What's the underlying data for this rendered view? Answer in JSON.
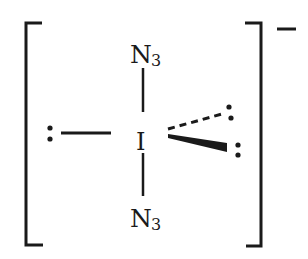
{
  "diagram": {
    "type": "lewis-structure",
    "charge": "−",
    "central_atom": "I",
    "top_group": {
      "element": "N",
      "subscript": "3"
    },
    "bottom_group": {
      "element": "N",
      "subscript": "3"
    },
    "ligands": [
      {
        "position": "axial-top",
        "label": "N3",
        "bond": "single"
      },
      {
        "position": "axial-bottom",
        "label": "N3",
        "bond": "single"
      },
      {
        "position": "equatorial-left",
        "label": "lone pair",
        "bond": "line"
      },
      {
        "position": "equatorial-back",
        "label": "lone pair",
        "bond": "dashed-wedge"
      },
      {
        "position": "equatorial-front",
        "label": "lone pair",
        "bond": "solid-wedge"
      }
    ],
    "colors": {
      "ink": "#1a1a1a",
      "background": "#ffffff"
    }
  }
}
